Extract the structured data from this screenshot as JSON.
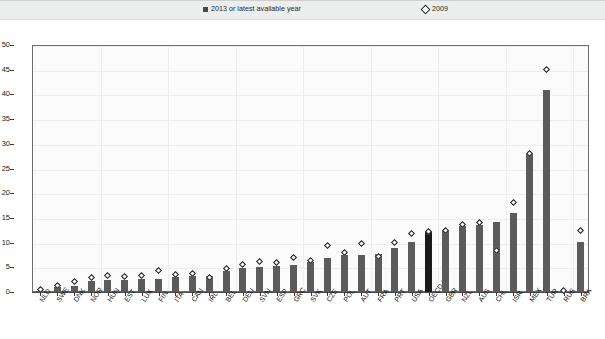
{
  "legend": {
    "series_1_label": "2013 or latest available year",
    "series_1_marker": "filled-square",
    "series_1_color": "#4a4a4a",
    "series_2_label": "2009",
    "series_2_marker": "open-diamond",
    "series_2_color": "#ffffff"
  },
  "axis": {
    "y_ticks": [
      "0",
      "5",
      "10",
      "15",
      "20",
      "25",
      "30",
      "35",
      "40",
      "45",
      "50"
    ]
  },
  "chart_data": {
    "type": "bar",
    "title": "",
    "subtitle": "",
    "xlabel": "",
    "ylabel": "",
    "ylim": [
      0,
      50
    ],
    "ytick_step": 5,
    "grid": true,
    "legend_position": "top",
    "highlight_category": "OECD 30",
    "highlight_color": "#1a1a1a",
    "bar_color": "#5b5b5b",
    "categories": [
      "NLD",
      "SWE",
      "DNK",
      "NOR",
      "HUN",
      "EST",
      "LUX",
      "FIN",
      "ITA",
      "CAN",
      "IRL",
      "BEL",
      "DEU",
      "SVN",
      "ESP",
      "GRC",
      "SVK",
      "CZE",
      "POL",
      "AUT",
      "FRA",
      "PRT",
      "USA",
      "OECD 30",
      "GBR",
      "NZL",
      "AUS",
      "CHL",
      "ISR",
      "MEX",
      "TUR",
      "RUS",
      "BRA"
    ],
    "series": [
      {
        "name": "2013 or latest available year",
        "marker": "bar",
        "values": [
          0.2,
          1.0,
          1.3,
          2.2,
          2.4,
          2.5,
          2.6,
          2.7,
          3.0,
          3.2,
          3.3,
          4.3,
          4.9,
          5.0,
          5.3,
          5.5,
          6.1,
          6.8,
          7.4,
          7.5,
          7.7,
          8.9,
          10.1,
          12.3,
          12.5,
          13.4,
          13.6,
          14.2,
          16.0,
          28.1,
          40.8,
          null,
          10.2
        ]
      },
      {
        "name": "2009",
        "marker": "diamond",
        "values": [
          0.5,
          1.3,
          2.2,
          3.0,
          3.3,
          3.2,
          3.3,
          4.4,
          3.5,
          3.8,
          3.0,
          4.8,
          5.6,
          6.2,
          5.9,
          7.0,
          6.4,
          9.5,
          8.0,
          9.8,
          7.2,
          10.1,
          11.9,
          12.3,
          12.5,
          13.6,
          14.0,
          8.4,
          18.2,
          28.1,
          45.1,
          0.3,
          12.4
        ]
      }
    ]
  }
}
